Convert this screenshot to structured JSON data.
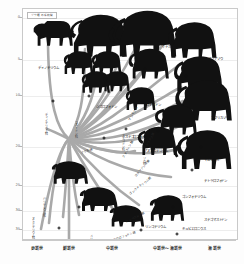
{
  "title_box": {
    "line1": "ゾウ類の系統樹"
  },
  "y_axis": {
    "unit": "Ma",
    "ticks": [
      {
        "label": "0",
        "pos": 4
      },
      {
        "label": "5",
        "pos": 22
      },
      {
        "label": "10",
        "pos": 38
      },
      {
        "label": "20",
        "pos": 60
      },
      {
        "label": "25",
        "pos": 77
      },
      {
        "label": "30",
        "pos": 88
      },
      {
        "label": "35",
        "pos": 96
      }
    ]
  },
  "x_axis": {
    "epochs": [
      {
        "label": "更新世",
        "pos": 7
      },
      {
        "label": "鮮新世",
        "pos": 22
      },
      {
        "label": "中新世",
        "pos": 42
      },
      {
        "label": "中新世〜漸新世",
        "pos": 68
      },
      {
        "label": "漸新世",
        "pos": 90
      }
    ]
  },
  "taxa": [
    {
      "name": "ディノテリウム",
      "x": 12,
      "y": 26
    },
    {
      "name": "アメリカマストドン",
      "x": 39,
      "y": 24
    },
    {
      "name": "ジゴロフォドン",
      "x": 39,
      "y": 43
    },
    {
      "name": "ステゴドン",
      "x": 61,
      "y": 42
    },
    {
      "name": "ステゴロフォドン",
      "x": 53,
      "y": 56
    },
    {
      "name": "ケナガマンモス",
      "x": 70,
      "y": 17
    },
    {
      "name": "アジアゾウ",
      "x": 90,
      "y": 22
    },
    {
      "name": "コロンビアマンモス",
      "x": 73,
      "y": 50
    },
    {
      "name": "アフリカゾウ",
      "x": 92,
      "y": 48
    },
    {
      "name": "アヌンコテリウム",
      "x": 62,
      "y": 62
    },
    {
      "name": "マムックス",
      "x": 88,
      "y": 66
    },
    {
      "name": "テトラロフォドン",
      "x": 90,
      "y": 75
    },
    {
      "name": "ゴンフォテリウム",
      "x": 80,
      "y": 82
    },
    {
      "name": "ステゴマストドン",
      "x": 90,
      "y": 92
    },
    {
      "name": "リンコテリウム",
      "x": 62,
      "y": 95
    },
    {
      "name": "キュビエロニウス",
      "x": 80,
      "y": 96
    },
    {
      "name": "プラティベロドン",
      "x": 74,
      "y": 104
    },
    {
      "name": "コロロフォドン",
      "x": 56,
      "y": 110
    },
    {
      "name": "モエリテリウム",
      "x": 20,
      "y": 110
    },
    {
      "name": "メリテリウム",
      "x": 38,
      "y": 110
    }
  ],
  "families": [
    {
      "name": "ディノテリウム科",
      "x": 11,
      "y": 50
    },
    {
      "name": "マストドン科",
      "x": 25,
      "y": 52
    },
    {
      "name": "バリテリウム科",
      "x": 10,
      "y": 86
    },
    {
      "name": "ヌミドテリウム科",
      "x": 5,
      "y": 95
    },
    {
      "name": "メリテリウム科",
      "x": 32,
      "y": 102
    },
    {
      "name": "ステゴドン科",
      "x": 47,
      "y": 58
    },
    {
      "name": "ゾウ科",
      "x": 57,
      "y": 66
    }
  ],
  "branch_labels": [
    {
      "name": "ゾウ形類",
      "x": 27,
      "y": 62,
      "rot": -20
    },
    {
      "name": "マンモス類",
      "x": 50,
      "y": 48,
      "rot": -62
    },
    {
      "name": "ステゴドン類",
      "x": 47,
      "y": 64,
      "rot": -62
    },
    {
      "name": "エレファス類",
      "x": 57,
      "y": 60,
      "rot": -58
    },
    {
      "name": "ロクソドンタ類",
      "x": 53,
      "y": 72,
      "rot": -50
    },
    {
      "name": "ゴンフォテリウム類",
      "x": 50,
      "y": 80,
      "rot": -38
    },
    {
      "name": "アメベロドン類",
      "x": 48,
      "y": 92,
      "rot": -26
    },
    {
      "name": "コロロフォドン類",
      "x": 42,
      "y": 100,
      "rot": -18
    }
  ],
  "nodes": [
    {
      "x": 22,
      "y": 118
    },
    {
      "x": 17,
      "y": 95
    },
    {
      "x": 14,
      "y": 40
    },
    {
      "x": 31,
      "y": 38
    },
    {
      "x": 38,
      "y": 56
    },
    {
      "x": 48,
      "y": 52
    },
    {
      "x": 57,
      "y": 26
    },
    {
      "x": 63,
      "y": 53
    },
    {
      "x": 76,
      "y": 29
    },
    {
      "x": 83,
      "y": 60
    },
    {
      "x": 79,
      "y": 70
    },
    {
      "x": 70,
      "y": 86
    },
    {
      "x": 55,
      "y": 96
    },
    {
      "x": 72,
      "y": 98
    },
    {
      "x": 63,
      "y": 107
    },
    {
      "x": 44,
      "y": 108
    },
    {
      "x": 29,
      "y": 105
    },
    {
      "x": 20,
      "y": 117
    },
    {
      "x": 12,
      "y": 114
    },
    {
      "x": 26,
      "y": 86
    }
  ],
  "colors": {
    "branch": "#a9a9a9",
    "silhouette": "#111111",
    "frame": "#c9c9c9",
    "grid": "#ededed",
    "text": "#111111"
  }
}
